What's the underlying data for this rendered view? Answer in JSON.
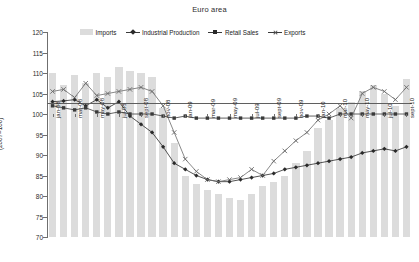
{
  "chart_data": {
    "type": "bar",
    "title": "Euro area",
    "xlabel": "",
    "ylabel": "(2007=100)",
    "ylim": [
      70,
      120
    ],
    "ytick_step": 5,
    "yticks": [
      70,
      75,
      80,
      85,
      90,
      95,
      100,
      105,
      110,
      115,
      120
    ],
    "grid": false,
    "legend_position": "top-center",
    "legend": [
      "Imports",
      "Industrial Production",
      "Retail Sales",
      "Exports"
    ],
    "x": [
      "jan-08",
      "feb-08",
      "mar-08",
      "apr-08",
      "may-08",
      "jun-08",
      "jul-08",
      "aug-08",
      "sept-08",
      "oct-08",
      "nov-08",
      "dec-08",
      "jan-09",
      "feb-09",
      "mar-09",
      "apr-09",
      "may-09",
      "jun-09",
      "jul-09",
      "aug-09",
      "sept-09",
      "oct-09",
      "nov-09",
      "dec-09",
      "jan-10",
      "feb-10",
      "mar-10",
      "apr-10",
      "may-10",
      "jun-10",
      "jul-10",
      "aug-10",
      "sept-10"
    ],
    "xtick_labels": [
      "jan-08",
      "mar-08",
      "may-08",
      "jul-08",
      "sept-08",
      "nov-08",
      "jan-09",
      "mar-09",
      "may-09",
      "jul-09",
      "sept-09",
      "nov-09",
      "jan-10",
      "mar-10",
      "may-10",
      "jul-10",
      "sept-10"
    ],
    "xtick_every": 2,
    "series": [
      {
        "name": "Imports",
        "type": "bar",
        "color": "#dcdcdc",
        "values": [
          110.0,
          107.0,
          109.5,
          107.5,
          110.0,
          109.0,
          111.5,
          110.5,
          110.0,
          109.0,
          101.5,
          93.0,
          85.0,
          83.0,
          81.5,
          80.5,
          79.5,
          79.0,
          80.5,
          82.5,
          83.5,
          85.0,
          88.0,
          91.0,
          96.5,
          98.5,
          101.5,
          103.0,
          105.5,
          107.0,
          105.0,
          102.0,
          108.5
        ]
      },
      {
        "name": "Industrial Production",
        "type": "line",
        "marker": "diamond",
        "color": "#2a2a2a",
        "values": [
          103.0,
          103.2,
          103.5,
          102.0,
          103.5,
          101.5,
          103.0,
          99.5,
          97.5,
          95.5,
          92.0,
          88.0,
          86.5,
          85.0,
          84.0,
          83.5,
          83.5,
          84.0,
          84.5,
          85.0,
          85.5,
          86.5,
          87.0,
          87.5,
          88.0,
          88.5,
          89.0,
          89.5,
          90.5,
          91.0,
          91.5,
          91.0,
          92.0
        ]
      },
      {
        "name": "Retail Sales",
        "type": "line",
        "marker": "square",
        "color": "#3a3a3a",
        "values": [
          102.0,
          101.5,
          101.0,
          101.5,
          100.5,
          100.0,
          100.5,
          100.0,
          100.0,
          100.0,
          99.5,
          99.0,
          99.5,
          99.0,
          99.0,
          99.0,
          99.0,
          99.0,
          99.0,
          99.0,
          99.0,
          99.0,
          99.0,
          99.5,
          99.5,
          99.0,
          100.0,
          100.0,
          100.0,
          100.0,
          100.0,
          100.0,
          100.0
        ]
      },
      {
        "name": "Exports",
        "type": "line",
        "marker": "cross",
        "color": "#6a6a6a",
        "values": [
          105.5,
          106.0,
          104.0,
          107.5,
          104.5,
          105.0,
          105.5,
          106.0,
          106.5,
          105.5,
          102.0,
          95.5,
          89.0,
          86.0,
          84.0,
          83.5,
          84.0,
          84.5,
          86.5,
          85.0,
          88.5,
          91.0,
          93.5,
          95.5,
          98.5,
          100.0,
          102.0,
          99.0,
          105.0,
          106.5,
          105.5,
          103.5,
          106.5
        ]
      }
    ]
  }
}
